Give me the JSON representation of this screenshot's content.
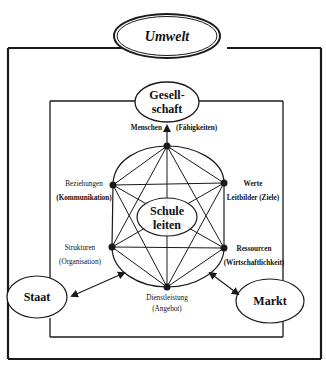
{
  "title": "Umwelt",
  "center": {
    "line1": "Schule",
    "line2": "leiten"
  },
  "outer_nodes": {
    "gesellschaft": {
      "line1": "Gesell-",
      "line2": "schaft"
    },
    "staat": "Staat",
    "markt": "Markt"
  },
  "star_nodes": {
    "top": {
      "left": "Menschen",
      "right": "(Fähigkeiten)"
    },
    "upper_left": {
      "line1": "Beziehungen",
      "line2": "(Kommunikation)"
    },
    "upper_right": {
      "line1": "Werte",
      "line2": "Leitbilder (Ziele)"
    },
    "lower_left": {
      "line1": "Strukturen",
      "line2": "(Organisation)"
    },
    "lower_right": {
      "line1": "Ressourcen",
      "line2": "(Wirtschaftlichkeit)"
    },
    "bottom": {
      "line1": "Dienstleistung",
      "line2": "(Angebot)"
    }
  },
  "colors": {
    "ink": "#1a1a1a",
    "background": "#ffffff"
  }
}
